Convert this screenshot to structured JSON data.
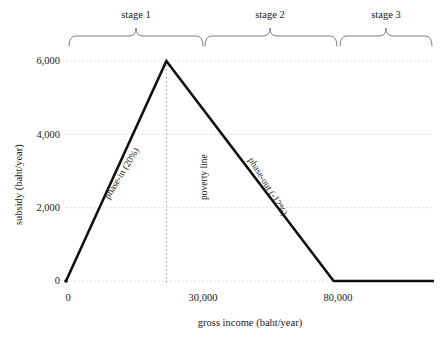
{
  "chart_data": {
    "type": "line",
    "title": "",
    "xlabel": "gross income (baht/year)",
    "ylabel": "subsidy (baht/year)",
    "xlim": [
      0,
      110000
    ],
    "ylim": [
      0,
      6800
    ],
    "grid": true,
    "legend_position": "none",
    "x": [
      0,
      30000,
      80000,
      110000
    ],
    "y": [
      0,
      6000,
      0,
      0
    ],
    "series": [
      {
        "name": "subsidy schedule",
        "x": [
          0,
          30000,
          80000,
          110000
        ],
        "values": [
          0,
          6000,
          0,
          0
        ]
      }
    ],
    "xticks": [
      {
        "value": 0,
        "label": "0"
      },
      {
        "value": 30000,
        "label": "30,000"
      },
      {
        "value": 80000,
        "label": "80,000"
      }
    ],
    "yticks": [
      {
        "value": 0,
        "label": "0"
      },
      {
        "value": 2000,
        "label": "2,000"
      },
      {
        "value": 4000,
        "label": "4,000"
      },
      {
        "value": 6000,
        "label": "6,000"
      }
    ],
    "annotations": [
      {
        "id": "phase-in",
        "text": "phase-in (20%)",
        "slope_percent": 20,
        "segment": [
          0,
          30000
        ]
      },
      {
        "id": "poverty-line",
        "text": "poverty line",
        "x_value": 30000
      },
      {
        "id": "phase-out",
        "text": "phase-out (-12%)",
        "slope_percent": -12,
        "segment": [
          30000,
          80000
        ]
      }
    ],
    "stages": [
      {
        "label": "stage 1",
        "x_start": 0,
        "x_end": 30000
      },
      {
        "label": "stage 2",
        "x_start": 30000,
        "x_end": 80000
      },
      {
        "label": "stage 3",
        "x_start": 80000,
        "x_end": 110000
      }
    ],
    "colors": {
      "line": "#111111",
      "grid": "#e2e2e2",
      "poverty_line": "#9a9a9a",
      "brace": "#6e6e6e",
      "text": "#1a1a1a",
      "background": "#ffffff"
    }
  }
}
